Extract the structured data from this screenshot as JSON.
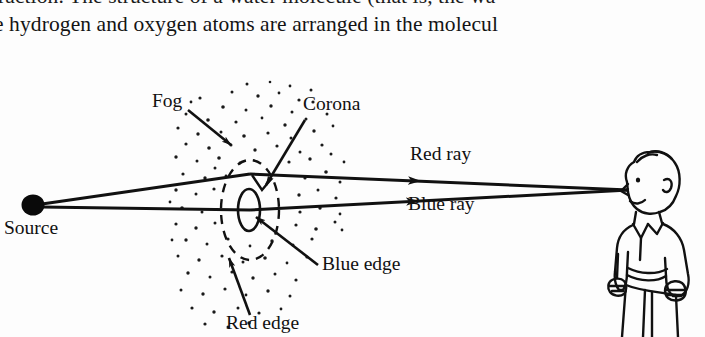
{
  "page": {
    "width": 705,
    "height": 337,
    "background_color": "#fdfdfd",
    "ink_color": "#111111"
  },
  "text_excerpt": {
    "line_1_clipped": "raction. The structure of a water molecule (that is, the wa",
    "line_2": "e hydrogen and oxygen atoms are arranged in the molecul"
  },
  "figure": {
    "labels": {
      "source": "Source",
      "fog": "Fog",
      "corona": "Corona",
      "red_ray": "Red ray",
      "blue_ray": "Blue ray",
      "blue_edge": "Blue edge",
      "red_edge": "Red edge"
    },
    "elements": {
      "source_dot": {
        "cx": 33,
        "cy": 143,
        "rx": 11,
        "ry": 10
      },
      "corona_apex": {
        "x": 250,
        "y": 112
      },
      "eye_point": {
        "x": 629,
        "y": 128
      },
      "red_edge_ellipse": {
        "cx": 250,
        "cy": 148,
        "rx": 29,
        "ry": 50,
        "style": "dashed"
      },
      "blue_edge_ellipse": {
        "cx": 249,
        "cy": 148,
        "rx": 11,
        "ry": 21,
        "style": "solid"
      },
      "fog_cloud": {
        "x": 175,
        "y": 30,
        "width": 170,
        "height": 225
      }
    },
    "label_positions": {
      "source": {
        "x": 4,
        "y": 172
      },
      "fog": {
        "x": 152,
        "y": 45
      },
      "corona": {
        "x": 303,
        "y": 48
      },
      "red_ray": {
        "x": 410,
        "y": 98
      },
      "blue_ray": {
        "x": 408,
        "y": 148
      },
      "blue_edge": {
        "x": 322,
        "y": 208
      },
      "red_edge": {
        "x": 226,
        "y": 267
      }
    },
    "observer": {
      "name": "man-observer",
      "description": "line drawing of a man facing left, arms at sides"
    }
  }
}
